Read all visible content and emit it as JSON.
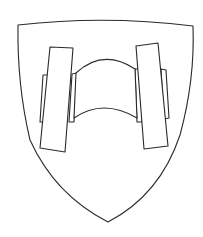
{
  "image": {
    "description": "Line drawing of a heraldic shield (coat of arms) bearing two upright beams joined by a curved band",
    "colors": {
      "background": "#ffffff",
      "stroke": "#2a2a2a",
      "fill": "#ffffff"
    }
  }
}
